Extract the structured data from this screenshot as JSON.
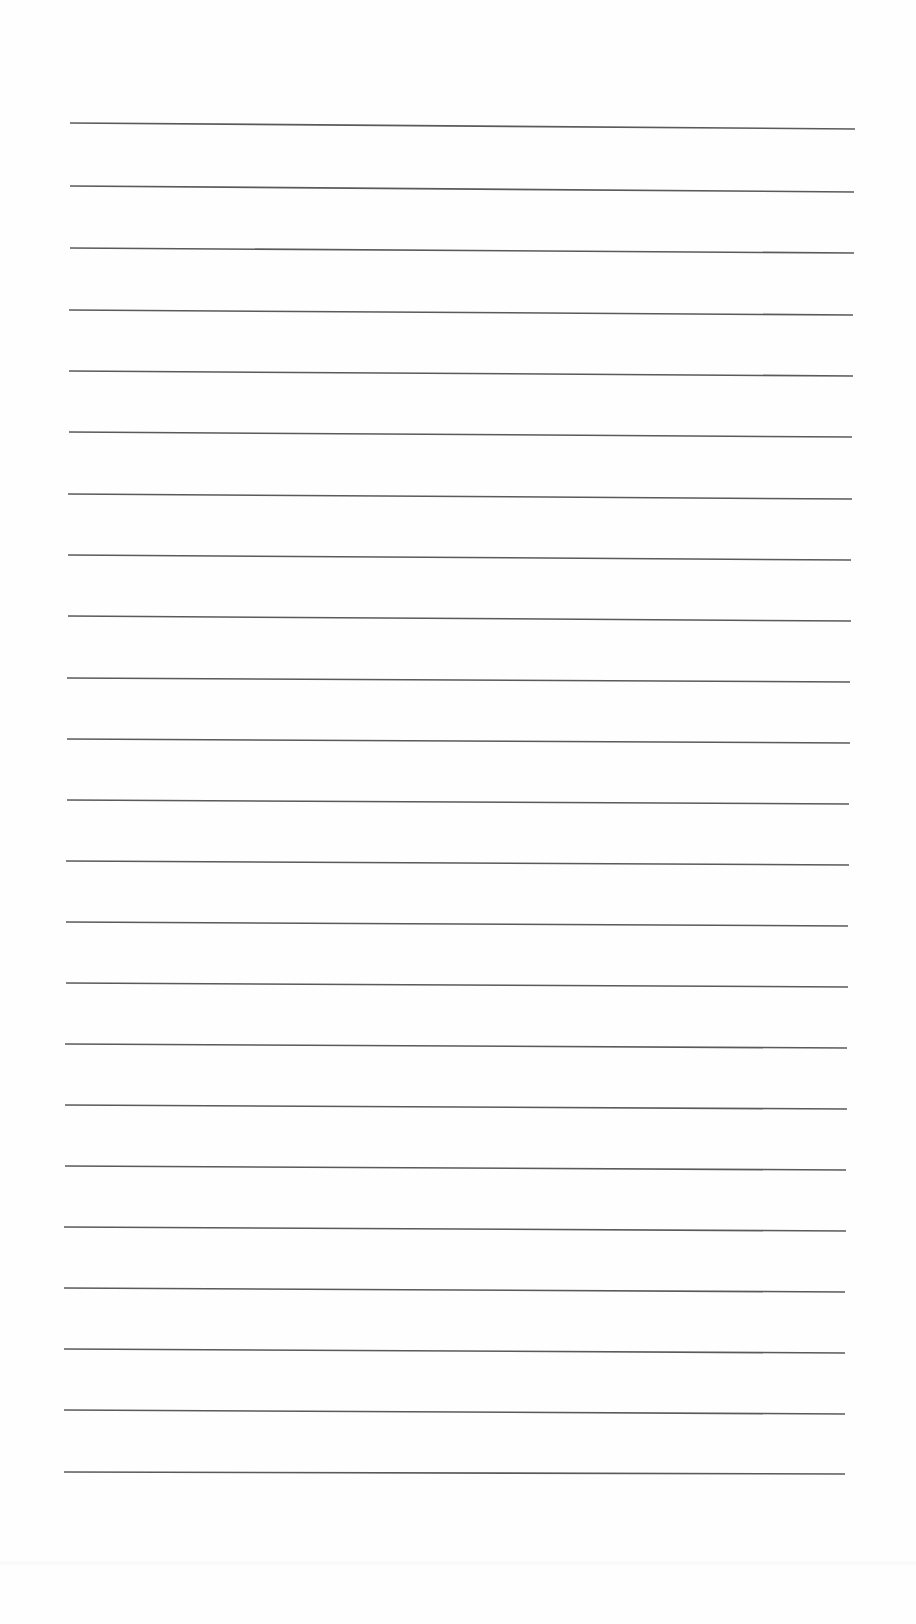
{
  "page": {
    "type": "lined-paper",
    "background_color": "#fefefe",
    "line_color": "#5a5a5a",
    "line_count": 19,
    "lines": [
      {
        "x1": 70,
        "y1": 123,
        "x2": 855,
        "y2": 129
      },
      {
        "x1": 70,
        "y1": 186,
        "x2": 854,
        "y2": 192
      },
      {
        "x1": 70,
        "y1": 248,
        "x2": 854,
        "y2": 253
      },
      {
        "x1": 69,
        "y1": 310,
        "x2": 853,
        "y2": 315
      },
      {
        "x1": 69,
        "y1": 371,
        "x2": 853,
        "y2": 376
      },
      {
        "x1": 69,
        "y1": 432,
        "x2": 852,
        "y2": 437
      },
      {
        "x1": 68,
        "y1": 494,
        "x2": 852,
        "y2": 499
      },
      {
        "x1": 68,
        "y1": 555,
        "x2": 851,
        "y2": 560
      },
      {
        "x1": 68,
        "y1": 616,
        "x2": 851,
        "y2": 621
      },
      {
        "x1": 67,
        "y1": 678,
        "x2": 850,
        "y2": 682
      },
      {
        "x1": 67,
        "y1": 739,
        "x2": 850,
        "y2": 743
      },
      {
        "x1": 67,
        "y1": 800,
        "x2": 849,
        "y2": 804
      },
      {
        "x1": 66,
        "y1": 861,
        "x2": 849,
        "y2": 865
      },
      {
        "x1": 66,
        "y1": 922,
        "x2": 848,
        "y2": 926
      },
      {
        "x1": 66,
        "y1": 983,
        "x2": 848,
        "y2": 987
      },
      {
        "x1": 65,
        "y1": 1044,
        "x2": 847,
        "y2": 1048
      },
      {
        "x1": 65,
        "y1": 1105,
        "x2": 847,
        "y2": 1109
      },
      {
        "x1": 65,
        "y1": 1166,
        "x2": 846,
        "y2": 1170
      },
      {
        "x1": 64,
        "y1": 1227,
        "x2": 846,
        "y2": 1231
      },
      {
        "x1": 64,
        "y1": 1288,
        "x2": 845,
        "y2": 1292
      },
      {
        "x1": 64,
        "y1": 1349,
        "x2": 845,
        "y2": 1353
      },
      {
        "x1": 64,
        "y1": 1410,
        "x2": 845,
        "y2": 1414
      },
      {
        "x1": 64,
        "y1": 1472,
        "x2": 845,
        "y2": 1474
      }
    ]
  }
}
